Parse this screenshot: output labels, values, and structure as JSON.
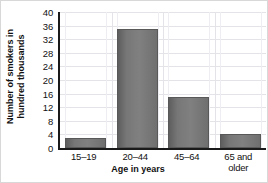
{
  "chart_data": {
    "type": "bar",
    "title": "",
    "subtitle": "",
    "xlabel": "Age in years",
    "ylabel": "Number of smokers in hundred thousands",
    "ylabel_line1": "Number of smokers in",
    "ylabel_line2": "hundred thousands",
    "categories": [
      "15–19",
      "20–44",
      "45–64",
      "65 and older"
    ],
    "values": [
      3,
      35,
      15,
      4
    ],
    "ylim": [
      0,
      40
    ],
    "yticks": [
      0,
      4,
      8,
      12,
      16,
      20,
      24,
      28,
      32,
      36,
      40
    ],
    "ytick_labels": [
      "0",
      "4",
      "8",
      "12",
      "16",
      "20",
      "24",
      "28",
      "32",
      "36",
      "40"
    ],
    "grid": true,
    "legend": "none",
    "bar_color": "#757575",
    "axis_color": "#1a1a1a",
    "grid_color": "#e3e3e8",
    "background": "#ffffff",
    "series": [
      {
        "name": "Number of smokers",
        "values": [
          3,
          35,
          15,
          4
        ]
      }
    ]
  },
  "category_labels": {
    "cat0_line1": "15–19",
    "cat0_line2": "",
    "cat1_line1": "20–44",
    "cat1_line2": "",
    "cat2_line1": "45–64",
    "cat2_line2": "",
    "cat3_line1": "65 and",
    "cat3_line2": "older"
  }
}
